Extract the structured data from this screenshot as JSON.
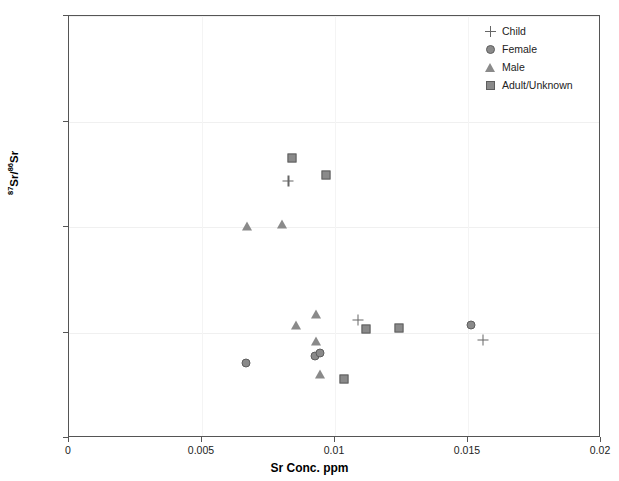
{
  "chart_data": {
    "type": "scatter",
    "title": "",
    "xlabel": "Sr Conc. ppm",
    "ylabel": "87Sr/86Sr",
    "ylabel_parts": {
      "sup1": "87",
      "mid": "Sr/",
      "sup2": "86",
      "end": "Sr"
    },
    "xlim": [
      0,
      0.02
    ],
    "ylim": [
      0.7095,
      0.7115
    ],
    "xticks": [
      "0",
      "0.005",
      "0.01",
      "0.015",
      "0.02"
    ],
    "xtick_values": [
      0,
      0.005,
      0.01,
      0.015,
      0.02
    ],
    "yticks": [
      "0.7095",
      "0.7100",
      "0.7105",
      "0.7110",
      "0.7115"
    ],
    "ytick_values": [
      0.7095,
      0.71,
      0.7105,
      0.711,
      0.7115
    ],
    "grid": true,
    "legend_position": "top-right",
    "marker_color": "#8a8a8a",
    "marker_edge_color": "#5e5e5e",
    "series": [
      {
        "name": "Child",
        "marker": "plus",
        "points": [
          {
            "x": 0.00825,
            "y": 0.71072
          },
          {
            "x": 0.01085,
            "y": 0.71006
          },
          {
            "x": 0.01555,
            "y": 0.709965
          }
        ]
      },
      {
        "name": "Female",
        "marker": "circle",
        "points": [
          {
            "x": 0.00665,
            "y": 0.709855
          },
          {
            "x": 0.00925,
            "y": 0.70989
          },
          {
            "x": 0.00945,
            "y": 0.709905
          },
          {
            "x": 0.0151,
            "y": 0.710035
          }
        ]
      },
      {
        "name": "Male",
        "marker": "triangle",
        "points": [
          {
            "x": 0.0067,
            "y": 0.710505
          },
          {
            "x": 0.008,
            "y": 0.710515
          },
          {
            "x": 0.00855,
            "y": 0.710035
          },
          {
            "x": 0.0093,
            "y": 0.71009
          },
          {
            "x": 0.0093,
            "y": 0.70996
          },
          {
            "x": 0.00945,
            "y": 0.709805
          }
        ]
      },
      {
        "name": "Adult/Unknown",
        "marker": "square",
        "points": [
          {
            "x": 0.0084,
            "y": 0.710825
          },
          {
            "x": 0.00965,
            "y": 0.710745
          },
          {
            "x": 0.01035,
            "y": 0.70978
          },
          {
            "x": 0.01115,
            "y": 0.710015
          },
          {
            "x": 0.0124,
            "y": 0.71002
          }
        ]
      }
    ]
  }
}
